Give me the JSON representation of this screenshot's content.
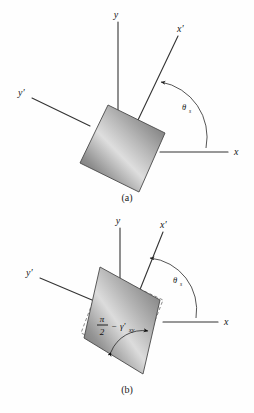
{
  "figure": {
    "background_color": "#fefefe",
    "ink_color": "#1a1a1a"
  },
  "panels": [
    {
      "id": "a",
      "caption": "(a)",
      "description": "Undeformed square element with rotated x'-y' axes",
      "axes": [
        {
          "name": "x-axis",
          "label": "x"
        },
        {
          "name": "y-axis",
          "label": "y"
        },
        {
          "name": "x-prime-axis",
          "label": "x′"
        },
        {
          "name": "y-prime-axis",
          "label": "y′"
        }
      ],
      "angle": {
        "symbol": "θ",
        "subscript": "s",
        "name": "theta-s"
      },
      "element": {
        "shape": "square",
        "fill": "gray-gradient"
      }
    },
    {
      "id": "b",
      "caption": "(b)",
      "description": "Sheared element shown as parallelogram with dashed original outline",
      "axes": [
        {
          "name": "x-axis",
          "label": "x"
        },
        {
          "name": "y-axis",
          "label": "y"
        },
        {
          "name": "x-prime-axis",
          "label": "x′"
        },
        {
          "name": "y-prime-axis",
          "label": "y′"
        }
      ],
      "angle": {
        "symbol": "θ",
        "subscript": "s",
        "name": "theta-s"
      },
      "interior_angle": {
        "numerator": "π",
        "denominator": "2",
        "operator": "−",
        "strain_symbol": "γ′",
        "strain_subscript": "xy"
      },
      "element": {
        "shape": "parallelogram",
        "fill": "gray-gradient",
        "outline": "dashed-original"
      }
    }
  ],
  "colors": {
    "gradient_dark": "#6f6f6f",
    "gradient_light": "#d8d8d8",
    "gradient_mid": "#a6a6a6",
    "stroke": "#4a4a4a",
    "axis": "#333333",
    "dashed": "#6b6b6b"
  }
}
